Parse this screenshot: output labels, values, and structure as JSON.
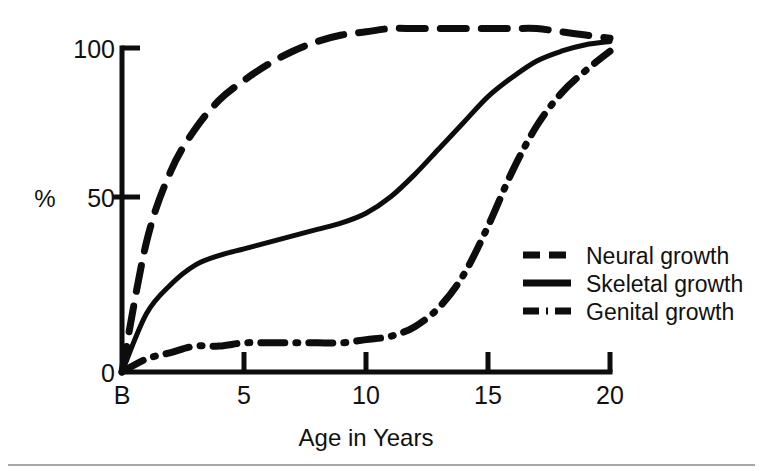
{
  "figure": {
    "background_color": "#ffffff",
    "ink_color": "#0d0d0d",
    "footer_rule_color": "#8a8a8a"
  },
  "axes": {
    "y_axis_unit_label": "%",
    "y_ticks": [
      "0",
      "50",
      "100"
    ],
    "x_ticks": [
      "B",
      "5",
      "10",
      "15",
      "20"
    ],
    "x_axis_title": "Age in Years"
  },
  "legend": {
    "items": [
      {
        "label": "Neural growth",
        "style": "dashed"
      },
      {
        "label": "Skeletal growth",
        "style": "solid"
      },
      {
        "label": "Genital growth",
        "style": "dash-dot"
      }
    ]
  },
  "chart_data": {
    "type": "line",
    "title": "",
    "subtitle": "",
    "xlabel": "Age in Years",
    "ylabel": "%",
    "xlim": [
      0,
      20
    ],
    "ylim": [
      0,
      110
    ],
    "grid": false,
    "legend_position": "right-middle",
    "x_tick_values": [
      0,
      5,
      10,
      15,
      20
    ],
    "x_tick_labels": [
      "B",
      "5",
      "10",
      "15",
      "20"
    ],
    "y_tick_values": [
      0,
      50,
      100
    ],
    "y_tick_labels": [
      "0",
      "50",
      "100"
    ],
    "x": [
      0,
      1,
      2,
      3,
      4,
      5,
      6,
      7,
      8,
      9,
      10,
      11,
      12,
      13,
      14,
      15,
      16,
      17,
      18,
      19,
      20
    ],
    "series": [
      {
        "name": "Neural growth",
        "style": "dashed",
        "values": [
          0,
          40,
          62,
          75,
          84,
          90,
          95,
          99,
          102,
          104,
          105,
          106,
          106,
          106,
          106,
          106,
          106,
          106,
          105,
          104,
          103
        ]
      },
      {
        "name": "Skeletal growth",
        "style": "solid",
        "values": [
          0,
          18,
          27,
          33,
          36,
          38,
          40,
          42,
          44,
          46,
          49,
          54,
          61,
          69,
          77,
          85,
          91,
          96,
          99,
          101,
          102
        ]
      },
      {
        "name": "Genital growth",
        "style": "dash-dot",
        "values": [
          0,
          4,
          6,
          8,
          8,
          9,
          9,
          9,
          9,
          9,
          10,
          11,
          14,
          20,
          30,
          45,
          62,
          76,
          86,
          93,
          99
        ]
      }
    ],
    "annotations": [
      "Neural growth is nearly complete by age 7-8 and plateaus slightly above 100%.",
      "Skeletal growth follows a slow-rise then adolescent-spurt S-curve.",
      "Genital growth stays near 10% until about age 12, then rises steeply to 100% by age 20."
    ]
  }
}
